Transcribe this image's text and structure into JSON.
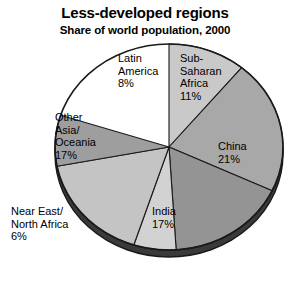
{
  "chart_data": {
    "type": "pie",
    "title": "Less-developed regions",
    "subtitle": "Share of world population, 2000",
    "xlabel": "",
    "ylabel": "",
    "legend_position": "none",
    "grid": false,
    "units": "percent of world population",
    "categories": [
      "Sub-Saharan Africa",
      "China",
      "India",
      "Near East/North Africa",
      "Other Asia/Oceania",
      "Latin America"
    ],
    "values": [
      11,
      21,
      17,
      6,
      17,
      8
    ],
    "start_angle_deg": 0,
    "direction": "clockwise",
    "slices": [
      {
        "name": "Sub-Saharan Africa",
        "label": "Sub-\nSaharan\nAfrica\n11%",
        "value": 11,
        "color": "#c9c9c9",
        "start_deg": 0,
        "end_deg": 39.6
      },
      {
        "name": "China",
        "label": "China\n21%",
        "value": 21,
        "color": "#a8a8a8",
        "start_deg": 39.6,
        "end_deg": 115.2
      },
      {
        "name": "India",
        "label": "India\n17%",
        "value": 17,
        "color": "#949494",
        "start_deg": 115.2,
        "end_deg": 176.4
      },
      {
        "name": "Near East/North Africa",
        "label": "Near East/\nNorth Africa\n6%",
        "value": 6,
        "color": "#d2d2d2",
        "start_deg": 176.4,
        "end_deg": 198.0
      },
      {
        "name": "Other Asia/Oceania",
        "label": "Other\nAsia/\nOceania\n17%",
        "value": 17,
        "color": "#c4c4c4",
        "start_deg": 198.0,
        "end_deg": 259.2
      },
      {
        "name": "Latin America",
        "label": "Latin\nAmerica\n8%",
        "value": 8,
        "color": "#9e9e9e",
        "start_deg": 259.2,
        "end_deg": 288.0
      }
    ],
    "colors": {
      "background": "#ffffff",
      "outline": "#1a1a1a",
      "rim_shadow": "#3a3a3a",
      "text": "#000000"
    }
  }
}
